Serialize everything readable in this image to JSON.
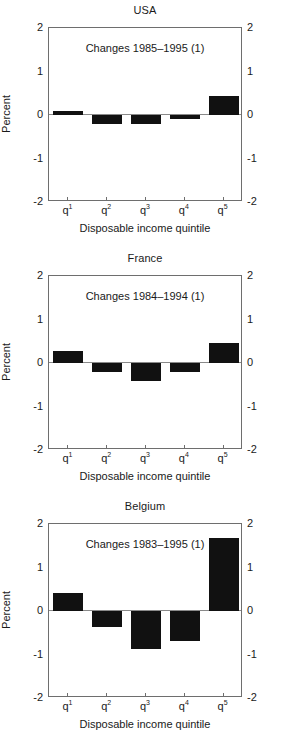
{
  "figure": {
    "axis_label_x": "Disposable income quintile",
    "axis_label_y": "Percent",
    "categories": [
      "q1",
      "q2",
      "q3",
      "q4",
      "q5"
    ],
    "category_labels_base": [
      "q",
      "q",
      "q",
      "q",
      "q"
    ],
    "category_labels_sup": [
      "1",
      "2",
      "3",
      "4",
      "5"
    ],
    "ytick_labels": [
      "2",
      "1",
      "0",
      "-1",
      "-2"
    ],
    "ytick_values": [
      2,
      1,
      0,
      -1,
      -2
    ],
    "bar_color": "#111111",
    "axis_color": "#6e6e6e"
  },
  "panels": [
    {
      "title": "USA",
      "annotation": "Changes 1985–1995 (1)",
      "values": [
        0.09,
        -0.2,
        -0.2,
        -0.09,
        0.44
      ]
    },
    {
      "title": "France",
      "annotation": "Changes 1984–1994 (1)",
      "values": [
        0.27,
        -0.21,
        -0.42,
        -0.21,
        0.46
      ]
    },
    {
      "title": "Belgium",
      "annotation": "Changes 1983–1995 (1)",
      "values": [
        0.41,
        -0.37,
        -0.88,
        -0.7,
        1.68
      ]
    }
  ],
  "chart_data": {
    "type": "bar",
    "title": "",
    "xlabel": "Disposable income quintile",
    "ylabel": "Percent",
    "categories": [
      "q1",
      "q2",
      "q3",
      "q4",
      "q5"
    ],
    "ylim": [
      -2,
      2
    ],
    "yticks": [
      -2,
      -1,
      0,
      1,
      2
    ],
    "grid": false,
    "legend": "none",
    "panels": [
      {
        "name": "USA",
        "annotation": "Changes 1985–1995 (1)",
        "values": [
          0.09,
          -0.2,
          -0.2,
          -0.09,
          0.44
        ]
      },
      {
        "name": "France",
        "annotation": "Changes 1984–1994 (1)",
        "values": [
          0.27,
          -0.21,
          -0.42,
          -0.21,
          0.46
        ]
      },
      {
        "name": "Belgium",
        "annotation": "Changes 1983–1995 (1)",
        "values": [
          0.41,
          -0.37,
          -0.88,
          -0.7,
          1.68
        ]
      }
    ]
  }
}
